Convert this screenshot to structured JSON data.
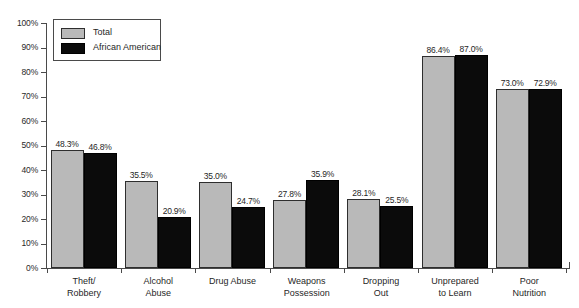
{
  "chart_data": {
    "type": "bar",
    "title": "",
    "xlabel": "",
    "ylabel": "",
    "ylim": [
      0,
      100
    ],
    "yticks": [
      "0%",
      "10%",
      "20%",
      "30%",
      "40%",
      "50%",
      "60%",
      "70%",
      "80%",
      "90%",
      "100%"
    ],
    "grid": false,
    "legend_position": "upper-left-inside",
    "categories": [
      "Theft/\nRobbery",
      "Alcohol\nAbuse",
      "Drug Abuse",
      "Weapons\nPossession",
      "Dropping\nOut",
      "Unprepared\nto Learn",
      "Poor\nNutrition"
    ],
    "series": [
      {
        "name": "Total",
        "color": "#b9b9b9",
        "values": [
          48.3,
          35.5,
          35.0,
          27.8,
          28.1,
          86.4,
          73.0
        ],
        "labels": [
          "48.3%",
          "35.5%",
          "35.0%",
          "27.8%",
          "28.1%",
          "86.4%",
          "73.0%"
        ]
      },
      {
        "name": "African American",
        "color": "#0b0b0b",
        "values": [
          46.8,
          20.9,
          24.7,
          35.9,
          25.5,
          87.0,
          72.9
        ],
        "labels": [
          "46.8%",
          "20.9%",
          "24.7%",
          "35.9%",
          "25.5%",
          "87.0%",
          "72.9%"
        ]
      }
    ]
  },
  "legend": {
    "items": [
      {
        "label": "Total",
        "swatch": "total"
      },
      {
        "label": "African American",
        "swatch": "aa"
      }
    ]
  }
}
